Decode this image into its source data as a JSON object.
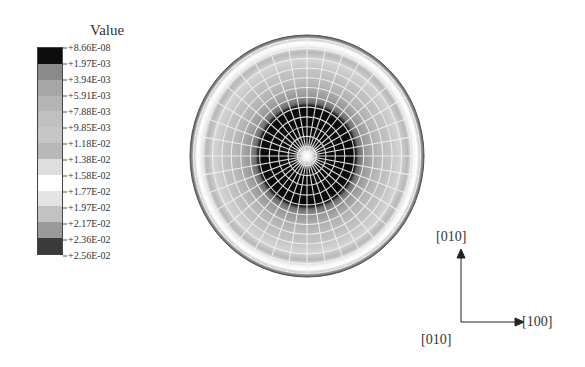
{
  "legend": {
    "title": "Value",
    "ticks": [
      "+8.66E-08",
      "+1.97E-03",
      "+3.94E-03",
      "+5.91E-03",
      "+7.88E-03",
      "+9.85E-03",
      "+1.18E-02",
      "+1.38E-02",
      "+1.58E-02",
      "+1.77E-02",
      "+1.97E-02",
      "+2.17E-02",
      "+2.36E-02",
      "+2.56E-02"
    ],
    "colors": [
      "#0d0d0d",
      "#8a8a8a",
      "#a6a6a6",
      "#b4b4b4",
      "#c0c0c0",
      "#c6c6c6",
      "#b8b8b8",
      "#dedede",
      "#ffffff",
      "#e4e4e4",
      "#c2c2c2",
      "#9a9a9a",
      "#3a3a3a"
    ]
  },
  "axes": {
    "vertical_label": "[010]",
    "horizontal_label": "[100]",
    "origin_label": "[010]"
  },
  "chart_data": {
    "type": "heatmap",
    "title": "Value",
    "colorbar": {
      "min": 8.66e-08,
      "max": 0.0256,
      "levels": [
        8.66e-08,
        0.00197,
        0.00394,
        0.00591,
        0.00788,
        0.00985,
        0.0118,
        0.0138,
        0.0158,
        0.0177,
        0.0197,
        0.0217,
        0.0236,
        0.0256
      ]
    },
    "radial_profile": [
      {
        "r_frac": 0.0,
        "value": 8.66e-08
      },
      {
        "r_frac": 0.42,
        "value": 0.00197
      },
      {
        "r_frac": 0.5,
        "value": 0.005
      },
      {
        "r_frac": 0.65,
        "value": 0.0118
      },
      {
        "r_frac": 0.8,
        "value": 0.0138
      },
      {
        "r_frac": 0.88,
        "value": 0.0158
      },
      {
        "r_frac": 0.95,
        "value": 0.0217
      },
      {
        "r_frac": 1.0,
        "value": 0.0256
      }
    ],
    "mesh": {
      "radial_lines": 36,
      "rings": 12
    },
    "axis_labels": {
      "up": "[010]",
      "right": "[100]",
      "origin": "[010]"
    }
  }
}
